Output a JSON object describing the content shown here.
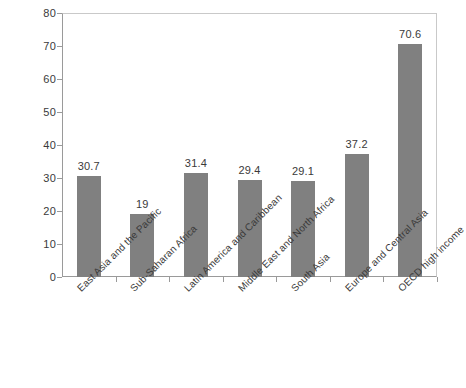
{
  "chart_data": {
    "type": "bar",
    "title": "",
    "subtitle": "",
    "xlabel": "",
    "ylabel": "",
    "ylim": [
      0,
      80
    ],
    "ytick_step": 10,
    "grid": false,
    "legend": null,
    "bar_color": "#808080",
    "axis_color": "#9a9a9a",
    "frame_color": "#c9c9c9",
    "categories": [
      "East Asia and the Pacific",
      "Sub-Saharan Africa",
      "Latin America and Caribbean",
      "Middle East and North Africa",
      "South Asia",
      "Europe and Central Asia",
      "OECD high income"
    ],
    "values": [
      30.7,
      19,
      31.4,
      29.4,
      29.1,
      37.2,
      70.6
    ],
    "value_labels": [
      "30.7",
      "19",
      "31.4",
      "29.4",
      "29.1",
      "37.2",
      "70.6"
    ],
    "yticks": [
      0,
      10,
      20,
      30,
      40,
      50,
      60,
      70,
      80
    ],
    "ytick_labels": [
      "0",
      "10",
      "20",
      "30",
      "40",
      "50",
      "60",
      "70",
      "80"
    ]
  }
}
